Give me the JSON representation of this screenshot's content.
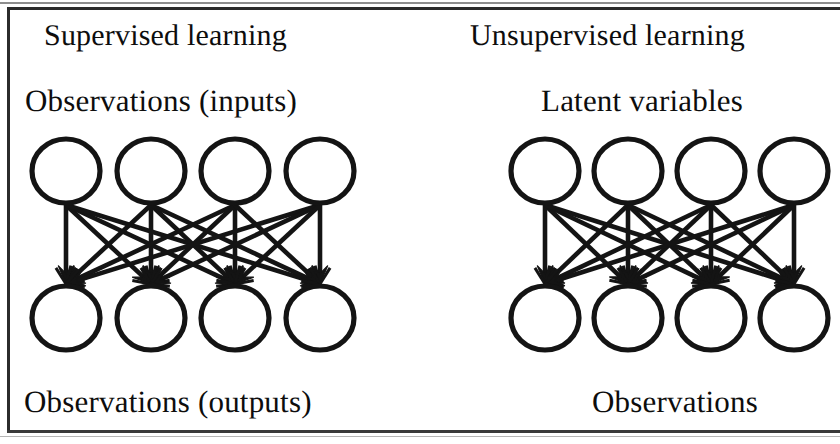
{
  "figure": {
    "type": "diagram",
    "subtype": "bipartite-neural-network-comparison",
    "panel_count": 2,
    "border_color": "#2b2b2b",
    "ink_color": "#141414",
    "background_color": "#ffffff"
  },
  "panels": [
    {
      "id": "supervised",
      "title": "Supervised learning",
      "top_layer_label": "Observations (inputs)",
      "bottom_layer_label": "Observations (outputs)",
      "top_node_count": 4,
      "bottom_node_count": 4,
      "edge_count": 16,
      "edge_direction": "top-to-bottom",
      "fully_connected": true,
      "node_radius": 34,
      "top_row_center_y": 171,
      "bottom_row_center_y": 318,
      "top_node_centers_x": [
        66,
        151,
        235,
        320
      ],
      "bottom_node_centers_x": [
        66,
        151,
        235,
        320
      ]
    },
    {
      "id": "unsupervised",
      "title": "Unsupervised learning",
      "top_layer_label": "Latent variables",
      "bottom_layer_label": "Observations",
      "top_node_count": 4,
      "bottom_node_count": 4,
      "edge_count": 16,
      "edge_direction": "top-to-bottom",
      "fully_connected": true,
      "node_radius": 34,
      "top_row_center_y": 171,
      "bottom_row_center_y": 318,
      "top_node_centers_x": [
        545,
        628,
        711,
        794
      ],
      "bottom_node_centers_x": [
        545,
        628,
        711,
        794
      ]
    }
  ]
}
